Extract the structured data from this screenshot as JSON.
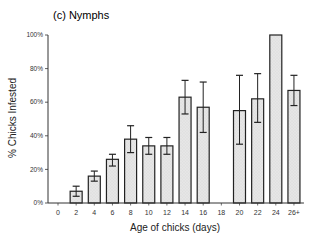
{
  "chart_data": {
    "type": "bar",
    "title": "(c) Nymphs",
    "xlabel": "Age of chicks (days)",
    "ylabel": "% Chicks Infested",
    "ylim": [
      0,
      100
    ],
    "yticks": [
      "0%",
      "20%",
      "40%",
      "60%",
      "80%",
      "100%"
    ],
    "grid": false,
    "legend": null,
    "categories": [
      "0",
      "2",
      "4",
      "6",
      "8",
      "10",
      "12",
      "14",
      "16",
      "18",
      "20",
      "22",
      "24",
      "26+"
    ],
    "values": [
      0,
      7,
      16,
      26,
      38,
      34,
      34,
      63,
      57,
      null,
      55,
      62,
      100,
      67
    ],
    "error_low": [
      null,
      4,
      13,
      22,
      30,
      29,
      29,
      53,
      42,
      null,
      35,
      48,
      null,
      58
    ],
    "error_high": [
      null,
      10,
      19,
      29,
      46,
      39,
      39,
      73,
      72,
      null,
      76,
      77,
      null,
      76
    ],
    "bar_fill": "#e4e4e4",
    "bar_stroke": "#222222"
  }
}
